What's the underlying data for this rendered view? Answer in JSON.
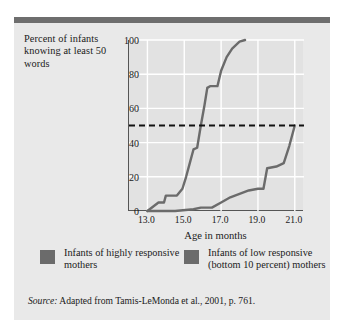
{
  "figure": {
    "y_caption": "Percent of infants knowing at least 50 words",
    "source_prefix": "Source:",
    "source_text": " Adapted from Tamis-LeMonda et al., 2001, p. 761."
  },
  "colors": {
    "card_background": "#e9e9e9",
    "header_bar": "#6e6e6e",
    "plot_background": "#e2e2e2",
    "gridline": "#ffffff",
    "axis": "#555555",
    "series": "#6b6b6b",
    "reference_line": "#111111"
  },
  "legend": {
    "items": [
      {
        "label": "Infants of highly responsive mothers",
        "color": "#6b6b6b"
      },
      {
        "label": "Infants of low responsive (bottom 10 percent) mothers",
        "color": "#6b6b6b"
      }
    ]
  },
  "chart_data": {
    "type": "line",
    "title": "",
    "xlabel": "Age in months",
    "ylabel": "Percent of infants knowing at least 50 words",
    "xlim": [
      12.0,
      21.5
    ],
    "ylim": [
      0,
      100
    ],
    "xticks": [
      "13.0",
      "15.0",
      "17.0",
      "19.0",
      "21.0"
    ],
    "xtick_values": [
      13.0,
      15.0,
      17.0,
      19.0,
      21.0
    ],
    "yticks": [
      "0",
      "20",
      "40",
      "60",
      "80",
      "100"
    ],
    "ytick_values": [
      0,
      20,
      40,
      60,
      80,
      100
    ],
    "grid": true,
    "legend_position": "below",
    "annotations": [
      {
        "type": "hline",
        "y": 50,
        "style": "dashed",
        "color": "#111111"
      }
    ],
    "series": [
      {
        "name": "Infants of highly responsive mothers",
        "color": "#6b6b6b",
        "x": [
          13.0,
          13.6,
          13.9,
          14.0,
          14.6,
          14.9,
          15.1,
          15.3,
          15.5,
          15.7,
          15.9,
          16.1,
          16.25,
          16.4,
          16.8,
          17.0,
          17.3,
          17.6,
          18.0,
          18.3
        ],
        "y": [
          0,
          5,
          5,
          9,
          9,
          13,
          20,
          28,
          36,
          37,
          50,
          62,
          72,
          73,
          73,
          82,
          90,
          95,
          99,
          100
        ]
      },
      {
        "name": "Infants of low responsive (bottom 10 percent) mothers",
        "color": "#6b6b6b",
        "x": [
          13.0,
          14.5,
          15.5,
          15.9,
          16.1,
          16.5,
          17.0,
          17.5,
          18.0,
          18.5,
          19.0,
          19.3,
          19.5,
          20.0,
          20.4,
          20.7,
          21.0
        ],
        "y": [
          0,
          0,
          1,
          2,
          2,
          2,
          5,
          8,
          10,
          12,
          13,
          13,
          25,
          26,
          28,
          38,
          50
        ]
      }
    ]
  }
}
